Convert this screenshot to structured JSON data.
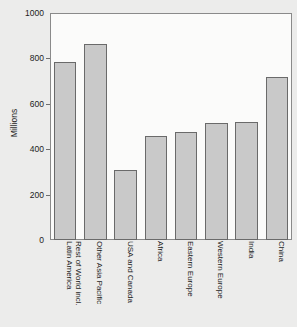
{
  "chart_data": {
    "type": "bar",
    "title": "",
    "xlabel": "",
    "ylabel": "Millions",
    "ylim": [
      0,
      1000
    ],
    "yticks": [
      0,
      200,
      400,
      600,
      800,
      1000
    ],
    "grid": false,
    "legend": "none",
    "categories": [
      "Rest of World incl. Latin America",
      "Other Asia Pacific",
      "USA and Canada",
      "Africa",
      "Eastern Europe",
      "Western Europe",
      "India",
      "China"
    ],
    "category_lines": [
      [
        "Rest of World incl.",
        "Latin America"
      ],
      [
        "Other Asia Pacific",
        ""
      ],
      [
        "USA and Canada",
        ""
      ],
      [
        "Africa",
        ""
      ],
      [
        "Eastern Europe",
        ""
      ],
      [
        "Western Europe",
        ""
      ],
      [
        "India",
        ""
      ],
      [
        "China",
        ""
      ]
    ],
    "values": [
      783,
      864,
      307,
      458,
      476,
      516,
      520,
      720
    ],
    "bar_color": "#c9c9c9",
    "bar_border_color": "#6a6a6a",
    "plot_background": "#fbfbfa",
    "figure_background": "#ececeb",
    "axis_color": "#8a8a8a",
    "text_color": "#1c1c1c"
  }
}
